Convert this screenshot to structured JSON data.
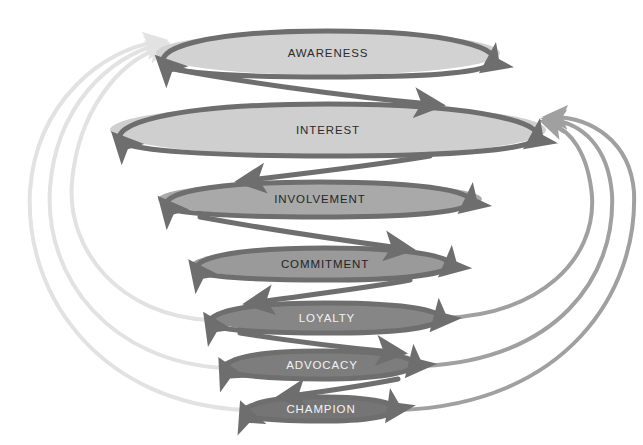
{
  "diagram": {
    "type": "spiral-funnel",
    "background_color": "#ffffff",
    "stages": [
      {
        "id": "awareness",
        "label": "AWARENESS",
        "order": 1,
        "cx": 328,
        "cy": 53,
        "rx": 172,
        "ry": 22,
        "fill": "#d2d2d2",
        "stroke": "#6e6e6e",
        "stroke_width": 5,
        "text_color": "#2b2b2b"
      },
      {
        "id": "interest",
        "label": "INTEREST",
        "order": 2,
        "cx": 328,
        "cy": 130,
        "rx": 218,
        "ry": 26,
        "fill": "#cfcfcf",
        "stroke": "#6e6e6e",
        "stroke_width": 5,
        "text_color": "#2b2b2b"
      },
      {
        "id": "involvement",
        "label": "INVOLVEMENT",
        "order": 3,
        "cx": 320,
        "cy": 199,
        "rx": 162,
        "ry": 18,
        "fill": "#a9a9a9",
        "stroke": "#6a6a6a",
        "stroke_width": 5,
        "text_color": "#262626"
      },
      {
        "id": "commitment",
        "label": "COMMITMENT",
        "order": 4,
        "cx": 325,
        "cy": 264,
        "rx": 133,
        "ry": 16,
        "fill": "#9a9a9a",
        "stroke": "#6a6a6a",
        "stroke_width": 5,
        "text_color": "#242424"
      },
      {
        "id": "loyalty",
        "label": "LOYALTY",
        "order": 5,
        "cx": 327,
        "cy": 318,
        "rx": 118,
        "ry": 15,
        "fill": "#868686",
        "stroke": "#6a6a6a",
        "stroke_width": 5,
        "text_color": "#f2f2f2"
      },
      {
        "id": "advocacy",
        "label": "ADVOCACY",
        "order": 6,
        "cx": 322,
        "cy": 365,
        "rx": 100,
        "ry": 14,
        "fill": "#7d7d7d",
        "stroke": "#6e6e6e",
        "stroke_width": 5,
        "text_color": "#f2f2f2"
      },
      {
        "id": "champion",
        "label": "CHAMPION",
        "order": 7,
        "cx": 321,
        "cy": 409,
        "rx": 79,
        "ry": 12,
        "fill": "#757575",
        "stroke": "#6e6e6e",
        "stroke_width": 5,
        "text_color": "#f4f4f4"
      }
    ],
    "spiral": {
      "color": "#6e6e6e",
      "width": 5,
      "description": "continuous descending helix threading every stage ellipse with arrowheads"
    },
    "left_arcs": {
      "color": "#e2e2e2",
      "width": 4,
      "count": 3,
      "direction": "upward to awareness",
      "from_stages": [
        "loyalty",
        "advocacy",
        "champion"
      ],
      "to_stage": "awareness"
    },
    "right_arcs": {
      "color": "#a0a0a0",
      "width": 4,
      "count": 3,
      "direction": "upward to interest",
      "from_stages": [
        "loyalty",
        "advocacy",
        "champion"
      ],
      "to_stage": "interest"
    }
  }
}
